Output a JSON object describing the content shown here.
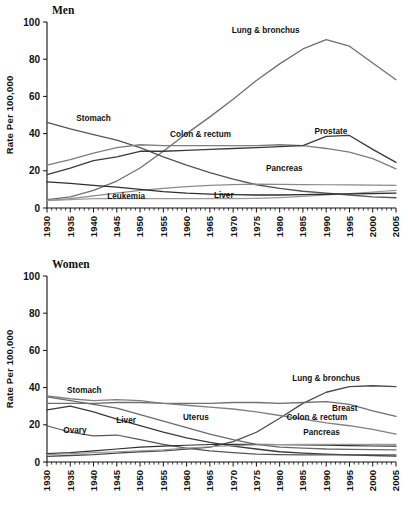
{
  "figure": {
    "width": 408,
    "height": 507,
    "background": "#ffffff"
  },
  "chart_data": [
    {
      "type": "line",
      "title": "Men",
      "xlabel": "",
      "ylabel": "Rate Per 100,000",
      "xlim": [
        1930,
        2005
      ],
      "ylim": [
        0,
        100
      ],
      "grid": false,
      "legend_position": "inline-annotations",
      "xticks": [
        1930,
        1935,
        1940,
        1945,
        1950,
        1955,
        1960,
        1965,
        1970,
        1975,
        1980,
        1985,
        1990,
        1995,
        2000,
        2005
      ],
      "xtick_labels": [
        "1930",
        "1935",
        "1940",
        "1945",
        "1950",
        "1955",
        "1960",
        "1965",
        "1970",
        "1975",
        "1980",
        "1985",
        "1990",
        "1995",
        "2000",
        "2005"
      ],
      "yticks": [
        0,
        20,
        40,
        60,
        80,
        100
      ],
      "ytick_labels": [
        "0",
        "20",
        "40",
        "60",
        "80",
        "100"
      ],
      "x": [
        1930,
        1935,
        1940,
        1945,
        1950,
        1955,
        1960,
        1965,
        1970,
        1975,
        1980,
        1985,
        1990,
        1995,
        2000,
        2005
      ],
      "series": [
        {
          "name": "Lung & bronchus",
          "color": "#6f6f6f",
          "width": 1.3,
          "label": "Lung & bronchus",
          "label_x": 1977,
          "label_y": 94,
          "values": [
            4.5,
            6.0,
            9.5,
            14.5,
            21.5,
            30.5,
            40.0,
            49.0,
            58.5,
            68.5,
            77.5,
            85.5,
            90.5,
            87.0,
            78.0,
            69.0
          ]
        },
        {
          "name": "Stomach",
          "color": "#555555",
          "width": 1.3,
          "label": "Stomach",
          "label_x": 1940,
          "label_y": 47,
          "values": [
            46.0,
            42.5,
            39.5,
            36.5,
            32.5,
            27.5,
            23.0,
            19.0,
            15.5,
            12.5,
            10.5,
            9.0,
            8.0,
            7.0,
            6.0,
            5.5
          ]
        },
        {
          "name": "Colon & rectum",
          "color": "#7e7e7e",
          "width": 1.3,
          "label": "Colon & rectum",
          "label_x": 1963,
          "label_y": 38,
          "values": [
            23.0,
            26.0,
            29.5,
            32.5,
            34.0,
            33.5,
            33.5,
            33.5,
            33.5,
            33.5,
            34.0,
            33.5,
            32.0,
            30.0,
            26.5,
            21.0
          ]
        },
        {
          "name": "Prostate",
          "color": "#3a3a3a",
          "width": 1.3,
          "label": "Prostate",
          "label_x": 1991,
          "label_y": 40,
          "values": [
            18.0,
            21.5,
            25.5,
            27.5,
            30.5,
            30.5,
            31.0,
            31.5,
            32.0,
            32.5,
            33.0,
            33.5,
            38.5,
            39.0,
            31.5,
            24.5
          ]
        },
        {
          "name": "Pancreas",
          "color": "#8a8a8a",
          "width": 1.2,
          "label": "Pancreas",
          "label_x": 1981,
          "label_y": 20,
          "values": [
            4.0,
            5.0,
            6.5,
            8.0,
            9.5,
            10.5,
            11.5,
            12.2,
            12.6,
            12.8,
            12.7,
            12.6,
            12.5,
            12.4,
            12.3,
            12.2
          ]
        },
        {
          "name": "Liver",
          "color": "#9a9a9a",
          "width": 1.2,
          "label": "Liver",
          "label_x": 1968,
          "label_y": 5.5,
          "values": [
            4.0,
            4.5,
            5.0,
            5.0,
            5.0,
            5.0,
            5.0,
            5.0,
            5.0,
            5.2,
            5.6,
            6.2,
            7.0,
            7.8,
            8.6,
            9.5
          ]
        },
        {
          "name": "Leukemia",
          "color": "#2e2e2e",
          "width": 1.3,
          "label": "Leukemia",
          "label_x": 1947,
          "label_y": 5.0,
          "values": [
            14.0,
            13.2,
            12.2,
            11.2,
            10.0,
            8.8,
            8.0,
            7.5,
            7.2,
            7.0,
            7.0,
            7.2,
            7.4,
            7.6,
            7.8,
            8.0
          ]
        }
      ]
    },
    {
      "type": "line",
      "title": "Women",
      "xlabel": "",
      "ylabel": "Rate Per 100,000",
      "xlim": [
        1930,
        2005
      ],
      "ylim": [
        0,
        100
      ],
      "grid": false,
      "legend_position": "inline-annotations",
      "xticks": [
        1930,
        1935,
        1940,
        1945,
        1950,
        1955,
        1960,
        1965,
        1970,
        1975,
        1980,
        1985,
        1990,
        1995,
        2000,
        2005
      ],
      "xtick_labels": [
        "1930",
        "1935",
        "1940",
        "1945",
        "1950",
        "1955",
        "1960",
        "1965",
        "1970",
        "1975",
        "1980",
        "1985",
        "1990",
        "1995",
        "2000",
        "2005"
      ],
      "yticks": [
        0,
        20,
        40,
        60,
        80,
        100
      ],
      "ytick_labels": [
        "0",
        "20",
        "40",
        "60",
        "80",
        "100"
      ],
      "x": [
        1930,
        1935,
        1940,
        1945,
        1950,
        1955,
        1960,
        1965,
        1970,
        1975,
        1980,
        1985,
        1990,
        1995,
        2000,
        2005
      ],
      "series": [
        {
          "name": "Lung & bronchus",
          "color": "#4a4a4a",
          "width": 1.3,
          "label": "Lung & bronchus",
          "label_x": 1990,
          "label_y": 43.5,
          "values": [
            3.0,
            3.5,
            4.0,
            4.8,
            5.5,
            6.0,
            7.0,
            8.0,
            11.0,
            16.0,
            23.5,
            31.5,
            37.5,
            40.5,
            41.0,
            40.5
          ]
        },
        {
          "name": "Breast",
          "color": "#6f6f6f",
          "width": 1.3,
          "label": "Breast",
          "label_x": 1994,
          "label_y": 27.5,
          "values": [
            31.5,
            31.5,
            31.5,
            32.0,
            32.0,
            31.5,
            31.5,
            31.5,
            32.0,
            32.0,
            31.5,
            32.0,
            32.5,
            31.0,
            27.5,
            24.5
          ]
        },
        {
          "name": "Colon & rectum",
          "color": "#808080",
          "width": 1.3,
          "label": "Colon & rectum",
          "label_x": 1988,
          "label_y": 22.5,
          "values": [
            35.5,
            34.0,
            33.0,
            33.5,
            33.0,
            31.5,
            30.5,
            29.5,
            28.5,
            27.0,
            25.0,
            23.0,
            21.0,
            19.5,
            17.5,
            15.0
          ]
        },
        {
          "name": "Stomach",
          "color": "#3a3a3a",
          "width": 1.3,
          "label": "Stomach",
          "label_x": 1938,
          "label_y": 37,
          "values": [
            28.0,
            30.0,
            27.0,
            23.0,
            19.5,
            16.0,
            13.0,
            10.5,
            8.5,
            7.0,
            5.5,
            4.8,
            4.2,
            3.8,
            3.5,
            3.2
          ]
        },
        {
          "name": "Uterus",
          "color": "#6a6a6a",
          "width": 1.3,
          "label": "Uterus",
          "label_x": 1962,
          "label_y": 22.5,
          "values": [
            35.0,
            33.0,
            31.0,
            29.0,
            25.5,
            22.0,
            18.5,
            15.0,
            12.0,
            9.5,
            8.0,
            7.5,
            7.0,
            6.8,
            6.6,
            6.5
          ]
        },
        {
          "name": "Liver",
          "color": "#555555",
          "width": 1.2,
          "label": "Liver",
          "label_x": 1947,
          "label_y": 21,
          "values": [
            19.5,
            16.0,
            14.0,
            14.5,
            12.0,
            9.5,
            7.5,
            6.0,
            5.0,
            4.2,
            4.0,
            3.8,
            3.8,
            3.8,
            3.8,
            3.8
          ]
        },
        {
          "name": "Ovary",
          "color": "#2e2e2e",
          "width": 1.2,
          "label": "Ovary",
          "label_x": 1936,
          "label_y": 15.5,
          "values": [
            4.5,
            5.0,
            6.0,
            7.0,
            8.0,
            8.5,
            9.0,
            9.4,
            9.5,
            9.5,
            9.3,
            9.2,
            9.0,
            8.8,
            8.6,
            8.5
          ]
        },
        {
          "name": "Pancreas",
          "color": "#9a9a9a",
          "width": 1.2,
          "label": "Pancreas",
          "label_x": 1989,
          "label_y": 14.5,
          "values": [
            4.0,
            4.5,
            5.0,
            5.5,
            6.0,
            6.5,
            7.5,
            8.2,
            8.8,
            9.2,
            9.4,
            9.5,
            9.5,
            9.5,
            9.5,
            9.5
          ]
        }
      ]
    }
  ]
}
